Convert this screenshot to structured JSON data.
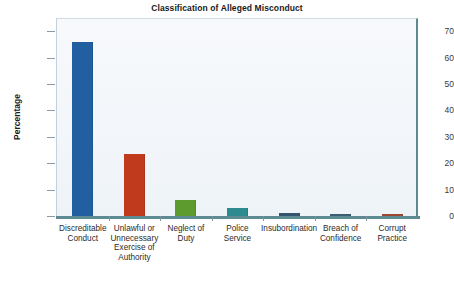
{
  "chart_data": {
    "type": "bar",
    "title": "Classification of Alleged Misconduct",
    "xlabel": "",
    "ylabel": "Percentage",
    "ylim": [
      0,
      75
    ],
    "yticks": [
      0,
      10,
      20,
      30,
      40,
      50,
      60,
      70
    ],
    "grid": false,
    "legend": "none",
    "categories": [
      "Discreditable Conduct",
      "Unlawful or Unnecessary Exercise of Authority",
      "Neglect of Duty",
      "Police Service",
      "Insubordination",
      "Breach of Confidence",
      "Corrupt Practice"
    ],
    "category_lines": [
      [
        "Discreditable",
        "Conduct"
      ],
      [
        "Unlawful or",
        "Unnecessary",
        "Exercise of",
        "Authority"
      ],
      [
        "Neglect of",
        "Duty"
      ],
      [
        "Police",
        "Service"
      ],
      [
        "Insubordination"
      ],
      [
        "Breach of",
        "Confidence"
      ],
      [
        "Corrupt",
        "Practice"
      ]
    ],
    "values": [
      66,
      23.5,
      6,
      3,
      1,
      0.7,
      0.6
    ],
    "bar_colors": [
      "#215FA0",
      "#C03A1D",
      "#5E9B2F",
      "#2D8A8E",
      "#34546E",
      "#3B5E74",
      "#9C4730"
    ]
  },
  "axis": {
    "y_tick_labels": [
      "70",
      "60",
      "50",
      "40",
      "30",
      "20",
      "10",
      "0"
    ]
  },
  "style": {
    "plot_background": "#F3F6FA",
    "axis_color": "#5D8A93",
    "text_color": "#1A1A1A"
  }
}
